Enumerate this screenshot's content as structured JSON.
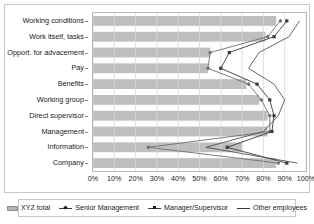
{
  "chart_data": {
    "type": "line",
    "title": "",
    "subtitle": "",
    "xlabel": "",
    "ylabel": "",
    "xlim": [
      0,
      100
    ],
    "xticks": [
      0,
      10,
      20,
      30,
      40,
      50,
      60,
      70,
      80,
      90,
      100
    ],
    "xtick_labels": [
      "0%",
      "10%",
      "20%",
      "30%",
      "40%",
      "50%",
      "60%",
      "70%",
      "80%",
      "90%",
      "100%"
    ],
    "grid": true,
    "legend_position": "bottom",
    "orientation": "horizontal",
    "categories": [
      "Working conditions",
      "Work itself, tasks",
      "Opport. for advacement",
      "Pay",
      "Benefits",
      "Working group",
      "Direct supervisor",
      "Management",
      "Information",
      "Company"
    ],
    "series": [
      {
        "name": "XYZ total",
        "type": "bar",
        "color": "#b3b3b3",
        "values": [
          86,
          81,
          55,
          54,
          72,
          78,
          82,
          82,
          70,
          86
        ]
      },
      {
        "name": "Senior Management",
        "type": "line",
        "marker": "diamond",
        "color": "#6e6e6e",
        "values": [
          88,
          82,
          55,
          54,
          73,
          79,
          83,
          83,
          26,
          87
        ]
      },
      {
        "name": "Manager/Supervisor",
        "type": "line",
        "marker": "square",
        "color": "#3a3a3a",
        "values": [
          91,
          85,
          64,
          60,
          77,
          83,
          85,
          84,
          63,
          91
        ]
      },
      {
        "name": "Other employees",
        "type": "line",
        "marker": "none",
        "color": "#555555",
        "values": [
          97,
          92,
          78,
          73,
          85,
          90,
          87,
          80,
          53,
          96
        ]
      }
    ]
  },
  "legend": {
    "items": [
      {
        "label": "XYZ total",
        "marker": "bar"
      },
      {
        "label": "Senior Management",
        "marker": "diamond"
      },
      {
        "label": "Manager/Supervisor",
        "marker": "square"
      },
      {
        "label": "Other employees",
        "marker": "none"
      }
    ]
  },
  "colors": {
    "bar": "#b3b3b3",
    "senior_management": "#6e6e6e",
    "manager_supervisor": "#3a3a3a",
    "other_employees": "#555555",
    "grid": "#d9d9d9",
    "frame": "#c8c8c8",
    "text": "#1a1a1a"
  }
}
